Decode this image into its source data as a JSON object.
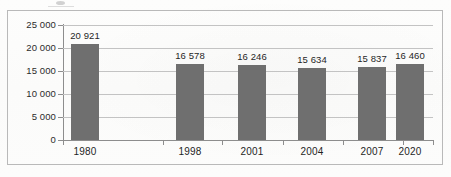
{
  "chart_data": {
    "type": "bar",
    "title": "",
    "subtitle": "",
    "xlabel": "",
    "ylabel": "",
    "categories": [
      "1980",
      "1998",
      "2001",
      "2004",
      "2007",
      "2020"
    ],
    "values": [
      20921,
      16578,
      16246,
      15634,
      15837,
      16460
    ],
    "value_labels": [
      "20 921",
      "16 578",
      "16 246",
      "15 634",
      "15 837",
      "16 460"
    ],
    "ylim": [
      0,
      25000
    ],
    "ytick_values": [
      0,
      5000,
      10000,
      15000,
      20000,
      25000
    ],
    "ytick_labels": [
      "0",
      "5 000",
      "10 000",
      "15 000",
      "20 000",
      "25 000"
    ],
    "grid": true,
    "grid_axis": "y",
    "legend": false,
    "legend_position": "none",
    "bar_color": "#6f6f6f",
    "gridline_color": "#c3c3c3",
    "axis_color": "#8d8d8d",
    "frame_color": "#b9b9b9",
    "text_color": "#262626",
    "thousands_separator": "space",
    "series": [
      {
        "name": "",
        "values": [
          20921,
          16578,
          16246,
          15634,
          15837,
          16460
        ]
      }
    ]
  },
  "figure": {
    "background_color": "#fdfdfc",
    "border_style": "thin-gray-rectangle"
  }
}
